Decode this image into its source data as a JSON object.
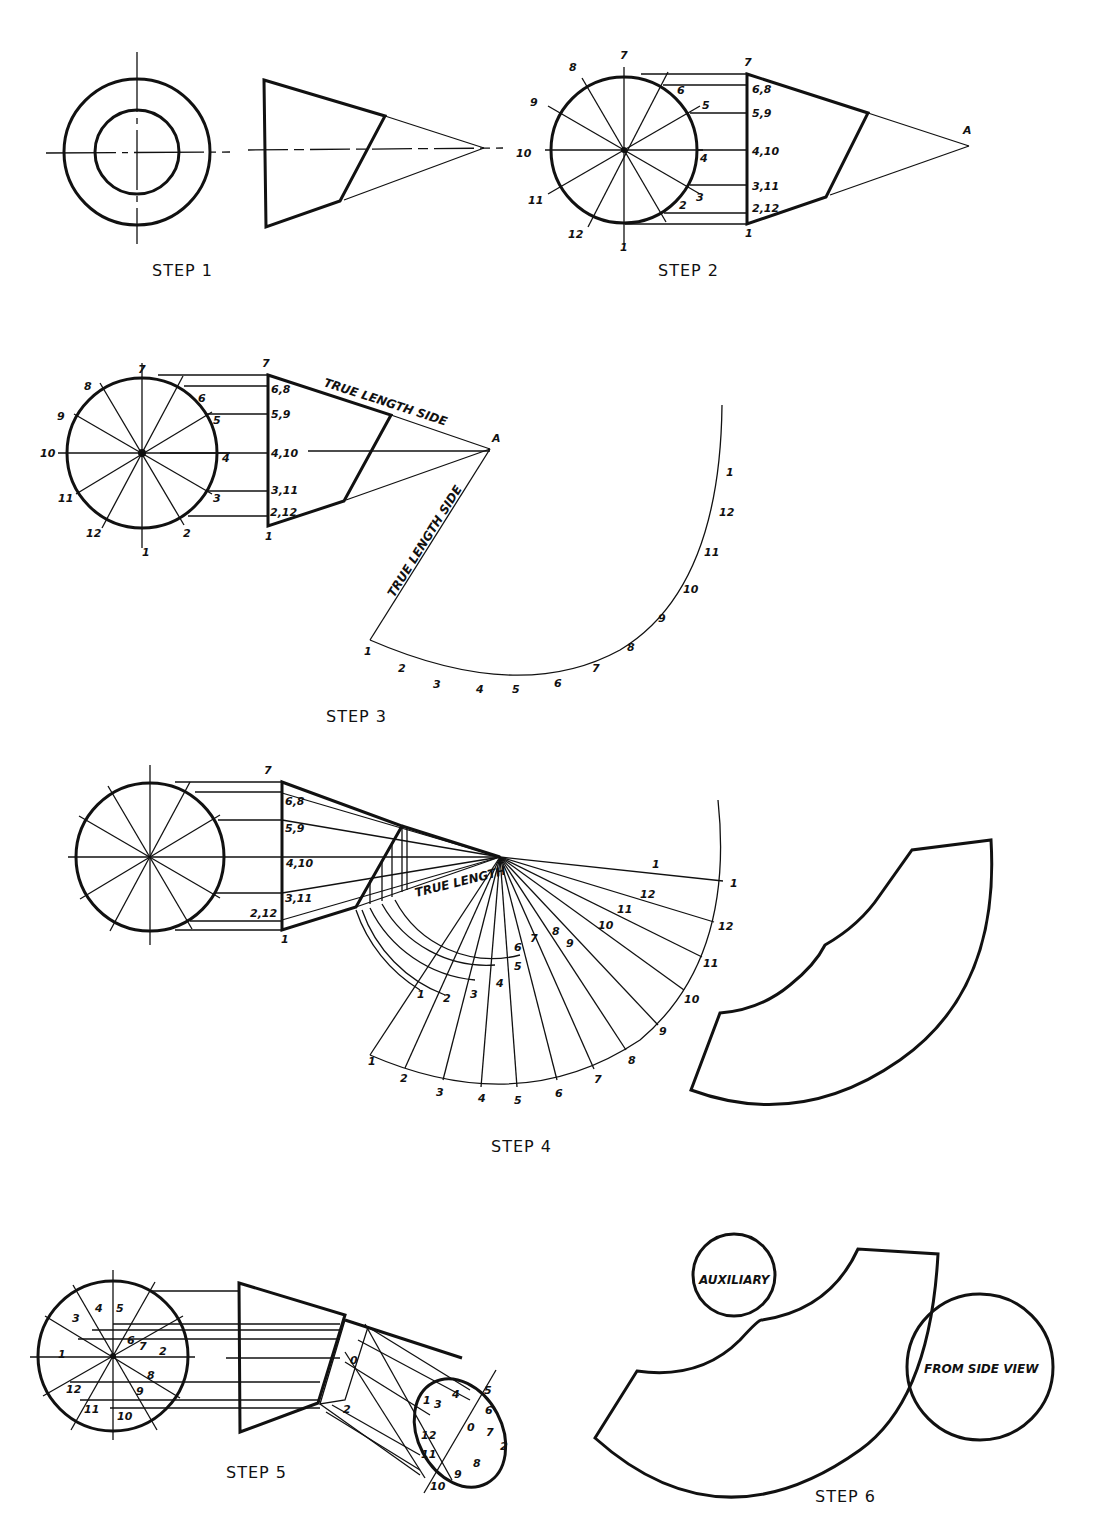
{
  "steps": [
    {
      "id": 1,
      "label": "STEP 1"
    },
    {
      "id": 2,
      "label": "STEP 2"
    },
    {
      "id": 3,
      "label": "STEP 3"
    },
    {
      "id": 4,
      "label": "STEP 4"
    },
    {
      "id": 5,
      "label": "STEP 5"
    },
    {
      "id": 6,
      "label": "STEP 6"
    }
  ],
  "step2": {
    "circle_labels": [
      "1",
      "2",
      "3",
      "4",
      "5",
      "6",
      "7",
      "8",
      "9",
      "10",
      "11",
      "12"
    ],
    "projection_labels": [
      "7",
      "6,8",
      "5,9",
      "4,10",
      "3,11",
      "2,12",
      "1"
    ],
    "apex_label": "A"
  },
  "step3": {
    "circle_labels": [
      "1",
      "2",
      "3",
      "4",
      "5",
      "6",
      "7",
      "8",
      "9",
      "10",
      "11",
      "12"
    ],
    "projection_labels": [
      "7",
      "6,8",
      "5,9",
      "4,10",
      "3,11",
      "2,12",
      "1"
    ],
    "apex_label": "A",
    "true_length_top": "TRUE LENGTH SIDE",
    "true_length_diag": "TRUE LENGTH SIDE",
    "arc_labels": [
      "1",
      "2",
      "3",
      "4",
      "5",
      "6",
      "7",
      "8",
      "9",
      "10",
      "11",
      "12",
      "1"
    ]
  },
  "step4": {
    "projection_labels": [
      "7",
      "6,8",
      "5,9",
      "4,10",
      "3,11",
      "2,12",
      "1"
    ],
    "true_length": "TRUE LENGTH",
    "inner_labels": [
      "1",
      "2",
      "3",
      "4",
      "5",
      "6",
      "7",
      "8",
      "9",
      "10",
      "11",
      "12",
      "1"
    ],
    "outer_labels": [
      "1",
      "2",
      "3",
      "4",
      "5",
      "6",
      "7",
      "8",
      "9",
      "10",
      "11",
      "12",
      "1"
    ]
  },
  "step5": {
    "circle_labels": [
      "1",
      "2",
      "3",
      "4",
      "5",
      "6",
      "7",
      "8",
      "9",
      "10",
      "11",
      "12"
    ],
    "aux_labels": [
      "0",
      "1",
      "2",
      "3",
      "4",
      "5",
      "6",
      "7",
      "8",
      "9",
      "10",
      "11",
      "12"
    ]
  },
  "step6": {
    "auxiliary_label": "AUXILIARY",
    "side_view_label": "FROM SIDE VIEW"
  }
}
